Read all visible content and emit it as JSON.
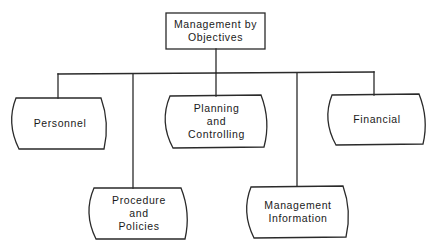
{
  "diagram": {
    "type": "organizational-tree",
    "root": {
      "id": "mbo",
      "lines": [
        "Management by",
        "Objectives"
      ],
      "shape": "rectangle"
    },
    "children": [
      {
        "id": "personnel",
        "lines": [
          "Personnel"
        ],
        "shape": "barrel",
        "row": 1
      },
      {
        "id": "procedure",
        "lines": [
          "Procedure",
          "and",
          "Policies"
        ],
        "shape": "barrel",
        "row": 2
      },
      {
        "id": "planning",
        "lines": [
          "Planning",
          "and",
          "Controlling"
        ],
        "shape": "barrel",
        "row": 1
      },
      {
        "id": "mgmt-info",
        "lines": [
          "Management",
          "Information"
        ],
        "shape": "barrel",
        "row": 2
      },
      {
        "id": "financial",
        "lines": [
          "Financial"
        ],
        "shape": "barrel",
        "row": 1
      }
    ],
    "colors": {
      "line": "#2a2a2a",
      "background": "#ffffff",
      "text": "#1a1a1a"
    }
  }
}
